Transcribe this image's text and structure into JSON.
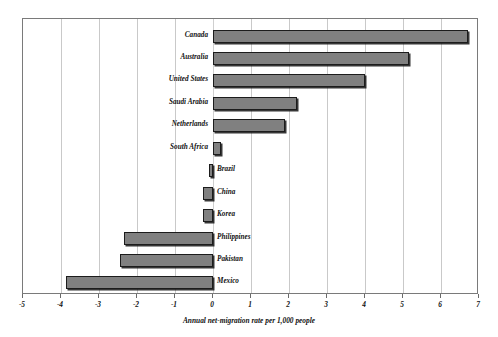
{
  "chart_data": {
    "type": "bar",
    "orientation": "horizontal",
    "title": "",
    "subtitle": "",
    "xlabel": "Annual net-migration rate per 1,000 people",
    "ylabel": "",
    "xlim": [
      -5,
      7
    ],
    "xticks": [
      -5,
      -4,
      -3,
      -2,
      -1,
      0,
      1,
      2,
      3,
      4,
      5,
      6,
      7
    ],
    "xtick_labels": [
      "-5",
      "-4",
      "-3",
      "-2",
      "-1",
      "0",
      "1",
      "2",
      "3",
      "4",
      "5",
      "6",
      "7"
    ],
    "grid": "vertical",
    "legend": "none",
    "bar_color": "#808080",
    "bar_edge_color": "#1c1c1c",
    "frame_color": "#7a7a7a",
    "gridline_color": "#c9c9c9",
    "categories": [
      "Canada",
      "Australia",
      "United States",
      "Saudi Arabia",
      "Netherlands",
      "South Africa",
      "Brazil",
      "China",
      "Korea",
      "Philippines",
      "Pakistan",
      "Mexico"
    ],
    "values": [
      6.7,
      5.15,
      4.0,
      2.2,
      1.9,
      0.2,
      -0.1,
      -0.26,
      -0.26,
      -2.34,
      -2.45,
      -3.87
    ],
    "points": [
      {
        "category": "Canada",
        "value": 6.7,
        "label_side": "left"
      },
      {
        "category": "Australia",
        "value": 5.15,
        "label_side": "left"
      },
      {
        "category": "United States",
        "value": 4.0,
        "label_side": "left"
      },
      {
        "category": "Saudi Arabia",
        "value": 2.2,
        "label_side": "left"
      },
      {
        "category": "Netherlands",
        "value": 1.9,
        "label_side": "left"
      },
      {
        "category": "South Africa",
        "value": 0.2,
        "label_side": "left"
      },
      {
        "category": "Brazil",
        "value": -0.1,
        "label_side": "right"
      },
      {
        "category": "China",
        "value": -0.26,
        "label_side": "right"
      },
      {
        "category": "Korea",
        "value": -0.26,
        "label_side": "right"
      },
      {
        "category": "Philippines",
        "value": -2.34,
        "label_side": "right"
      },
      {
        "category": "Pakistan",
        "value": -2.45,
        "label_side": "right"
      },
      {
        "category": "Mexico",
        "value": -3.87,
        "label_side": "right"
      }
    ]
  }
}
